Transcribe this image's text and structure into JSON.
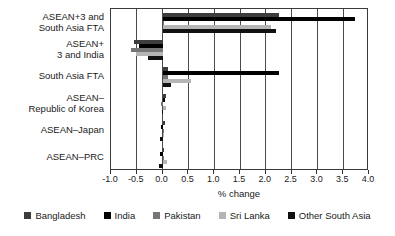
{
  "chart_data": {
    "type": "bar",
    "orientation": "horizontal",
    "title": "",
    "xlabel": "% change",
    "ylabel": "",
    "xlim": [
      -1.0,
      4.0
    ],
    "xticks": [
      -1.0,
      -0.5,
      0.0,
      0.5,
      1.0,
      1.5,
      2.0,
      2.5,
      3.0,
      3.5,
      4.0
    ],
    "xtick_labels": [
      "-1.0",
      "-0.5",
      "0.0",
      "0.5",
      "1.0",
      "1.5",
      "2.0",
      "2.5",
      "3.0",
      "3.5",
      "4.0"
    ],
    "grid": true,
    "legend_position": "bottom",
    "categories": [
      "ASEAN+3 and\nSouth Asia FTA",
      "ASEAN+\n3 and India",
      "South Asia FTA",
      "ASEAN–\nRepublic of Korea",
      "ASEAN–Japan",
      "ASEAN–PRC"
    ],
    "series": [
      {
        "name": "Bangladesh",
        "color": "#3d3d3d",
        "values": [
          2.25,
          -0.55,
          0.1,
          0.06,
          0.04,
          0.03
        ]
      },
      {
        "name": "India",
        "color": "#000000",
        "values": [
          3.72,
          -0.45,
          2.25,
          0.05,
          -0.03,
          -0.05
        ]
      },
      {
        "name": "Pakistan",
        "color": "#767676",
        "values": [
          0.0,
          -0.62,
          0.1,
          -0.04,
          0.02,
          0.03
        ]
      },
      {
        "name": "Sri Lanka",
        "color": "#b5b5b5",
        "values": [
          2.1,
          -0.52,
          0.55,
          0.06,
          0.02,
          0.08
        ]
      },
      {
        "name": "Other South Asia",
        "color": "#111111",
        "values": [
          2.2,
          -0.28,
          0.17,
          -0.02,
          -0.06,
          -0.07
        ]
      }
    ]
  },
  "legend": {
    "items": [
      {
        "label": "Bangladesh",
        "color": "#3d3d3d"
      },
      {
        "label": "India",
        "color": "#000000"
      },
      {
        "label": "Pakistan",
        "color": "#767676"
      },
      {
        "label": "Sri Lanka",
        "color": "#b5b5b5"
      },
      {
        "label": "Other South Asia",
        "color": "#111111"
      }
    ]
  }
}
